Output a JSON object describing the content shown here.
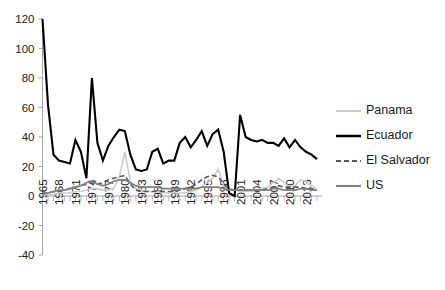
{
  "chart_data": {
    "type": "line",
    "title": "",
    "subtitle": "",
    "xlabel": "",
    "ylabel": "",
    "grid": false,
    "legend_position": "right",
    "xlim": [
      1965,
      2015
    ],
    "ylim": [
      -40,
      120
    ],
    "y_ticks": [
      120,
      100,
      80,
      60,
      40,
      20,
      0,
      -20,
      -40
    ],
    "y_tick_labels": [
      "120",
      "100",
      "80",
      "60",
      "40",
      "20",
      "0",
      "-20",
      "-40"
    ],
    "x_tick_labels": [
      "1965",
      "1968",
      "1971",
      "1974",
      "1977",
      "1980",
      "1983",
      "1986",
      "1989",
      "1992",
      "1995",
      "1998",
      "2001",
      "2004",
      "2007",
      "2010",
      "2013"
    ],
    "x_tick_years": [
      1965,
      1968,
      1971,
      1974,
      1977,
      1980,
      1983,
      1986,
      1989,
      1992,
      1995,
      1998,
      2001,
      2004,
      2007,
      2010,
      2013
    ],
    "x_all_years": [
      1965,
      1966,
      1967,
      1968,
      1969,
      1970,
      1971,
      1972,
      1973,
      1974,
      1975,
      1976,
      1977,
      1978,
      1979,
      1980,
      1981,
      1982,
      1983,
      1984,
      1985,
      1986,
      1987,
      1988,
      1989,
      1990,
      1991,
      1992,
      1993,
      1994,
      1995,
      1996,
      1997,
      1998,
      1999,
      2000,
      2001,
      2002,
      2003,
      2004,
      2005,
      2006,
      2007,
      2008,
      2009,
      2010,
      2011,
      2012,
      2013,
      2014,
      2015
    ],
    "series": [
      {
        "name": "Panama",
        "color": "#cccccc",
        "width": 1.6,
        "dash": "none",
        "values": [
          1,
          1,
          1,
          2,
          2,
          2,
          3,
          3,
          4,
          5,
          5,
          4,
          4,
          5,
          13,
          30,
          10,
          5,
          4,
          3,
          3,
          3,
          2,
          2,
          2,
          2,
          2,
          3,
          4,
          6,
          9,
          12,
          18,
          7,
          4,
          4,
          3,
          3,
          3,
          4,
          5,
          6,
          9,
          12,
          9,
          6,
          7,
          11,
          10,
          7,
          5
        ]
      },
      {
        "name": "Ecuador",
        "color": "#000000",
        "width": 2.1,
        "dash": "none",
        "values": [
          120,
          62,
          28,
          24,
          23,
          22,
          38,
          30,
          12,
          80,
          36,
          24,
          34,
          40,
          45,
          44,
          28,
          18,
          17,
          18,
          30,
          32,
          22,
          24,
          24,
          36,
          40,
          33,
          38,
          44,
          34,
          42,
          45,
          30,
          2,
          0,
          55,
          40,
          38,
          37,
          38,
          36,
          36,
          34,
          39,
          33,
          38,
          33,
          30,
          28,
          25
        ]
      },
      {
        "name": "El Salvador",
        "color": "#595959",
        "width": 1.6,
        "dash": "5,3",
        "values": [
          2,
          2,
          3,
          3,
          4,
          5,
          6,
          7,
          8,
          9,
          8,
          9,
          11,
          12,
          13,
          14,
          8,
          4,
          3,
          3,
          3,
          3,
          3,
          3,
          3,
          4,
          5,
          6,
          8,
          11,
          13,
          14,
          13,
          8,
          5,
          4,
          4,
          4,
          4,
          4,
          4,
          5,
          6,
          7,
          6,
          6,
          6,
          6,
          5,
          5,
          4
        ]
      },
      {
        "name": "US",
        "color": "#808080",
        "width": 1.7,
        "dash": "none",
        "values": [
          1,
          2,
          3,
          4,
          4,
          5,
          6,
          7,
          9,
          10,
          8,
          7,
          8,
          10,
          11,
          11,
          9,
          7,
          6,
          6,
          6,
          6,
          5,
          5,
          5,
          5,
          5,
          5,
          5,
          6,
          6,
          6,
          6,
          5,
          4,
          4,
          4,
          4,
          4,
          4,
          4,
          4,
          5,
          5,
          4,
          4,
          4,
          5,
          5,
          4,
          4
        ]
      }
    ]
  },
  "legend": {
    "items": [
      {
        "label": "Panama"
      },
      {
        "label": "Ecuador"
      },
      {
        "label": "El Salvador"
      },
      {
        "label": "US"
      }
    ]
  }
}
